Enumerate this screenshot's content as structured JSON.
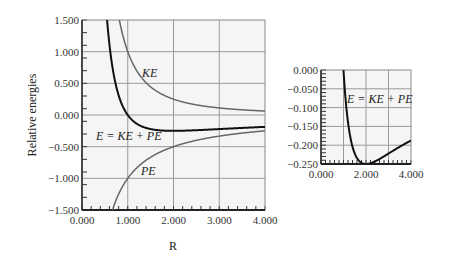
{
  "chart_data": [
    {
      "type": "line",
      "title": "",
      "xlabel": "R",
      "ylabel": "Relative energies",
      "xlim": [
        0,
        4
      ],
      "ylim": [
        -1.5,
        1.5
      ],
      "xticks": [
        "0.000",
        "1.000",
        "2.000",
        "3.000",
        "4.000"
      ],
      "yticks": [
        "1.500",
        "1.000",
        "0.500",
        "0.000",
        "−0.500",
        "−1.000",
        "−1.500"
      ],
      "grid": true,
      "series": [
        {
          "name": "KE",
          "color": "#666666",
          "x": [
            0.8,
            1.0,
            1.5,
            2.0,
            2.5,
            3.0,
            3.5,
            4.0
          ],
          "values": [
            1.56,
            1.0,
            0.444,
            0.25,
            0.16,
            0.111,
            0.082,
            0.0625
          ]
        },
        {
          "name": "PE",
          "color": "#666666",
          "x": [
            0.67,
            0.8,
            1.0,
            1.5,
            2.0,
            2.5,
            3.0,
            3.5,
            4.0
          ],
          "values": [
            -1.5,
            -1.25,
            -1.0,
            -0.667,
            -0.5,
            -0.4,
            -0.333,
            -0.286,
            -0.25
          ]
        },
        {
          "name": "E = KE + PE",
          "color": "#111111",
          "x": [
            0.6,
            0.8,
            1.0,
            1.5,
            2.0,
            2.5,
            3.0,
            3.5,
            4.0
          ],
          "values": [
            1.11,
            0.3125,
            0.0,
            -0.222,
            -0.25,
            -0.24,
            -0.222,
            -0.204,
            -0.1875
          ]
        }
      ],
      "annotations": [
        "KE",
        "E = KE + PE",
        "PE"
      ]
    },
    {
      "type": "line",
      "title": "",
      "xlabel": "",
      "ylabel": "",
      "xlim": [
        0,
        4
      ],
      "ylim": [
        -0.25,
        0
      ],
      "xticks": [
        "0.000",
        "2.000",
        "4.000"
      ],
      "yticks": [
        "0.000",
        "−0.050",
        "−0.100",
        "−0.150",
        "−0.200",
        "−0.250"
      ],
      "grid": true,
      "series": [
        {
          "name": "E = KE + PE",
          "color": "#111111",
          "x": [
            1.0,
            1.25,
            1.5,
            2.0,
            2.5,
            3.0,
            3.5,
            4.0
          ],
          "values": [
            0.0,
            -0.16,
            -0.222,
            -0.25,
            -0.24,
            -0.222,
            -0.204,
            -0.1875
          ]
        }
      ],
      "annotations": [
        "E = KE + PE"
      ]
    }
  ]
}
